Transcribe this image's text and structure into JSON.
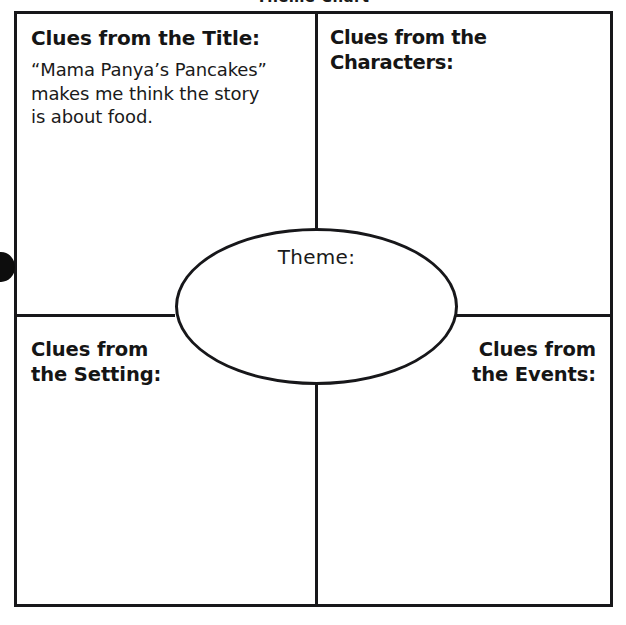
{
  "sheet": {
    "title": "Theme Chart",
    "center": {
      "label": "Theme:",
      "value": ""
    },
    "quadrants": [
      {
        "id": "title",
        "heading": "Clues from the Title:",
        "response": "“Mama Panya’s Pancakes”\nmakes me think the story\nis about food."
      },
      {
        "id": "characters",
        "heading": "Clues from the Characters:",
        "response": ""
      },
      {
        "id": "setting",
        "heading": "Clues from\nthe Setting:",
        "response": ""
      },
      {
        "id": "events",
        "heading": "Clues from\nthe Events:",
        "response": ""
      }
    ]
  },
  "colors": {
    "ink": "#17171a",
    "paper": "#ffffff"
  }
}
